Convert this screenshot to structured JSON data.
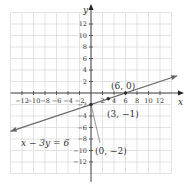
{
  "chart_data": {
    "type": "line",
    "title": "",
    "xlabel": "x",
    "ylabel": "y",
    "xlim": [
      -14,
      15
    ],
    "ylim": [
      -14,
      15
    ],
    "grid": true,
    "x_ticks": [
      -12,
      -10,
      -8,
      -6,
      -4,
      -2,
      2,
      4,
      6,
      8,
      10,
      12
    ],
    "y_ticks": [
      12,
      10,
      8,
      6,
      4,
      2,
      -2,
      -4,
      -6,
      -8,
      -10,
      -12
    ],
    "x_tick_labels": [
      "−12",
      "−10",
      "−8",
      "−6",
      "−4",
      "−2",
      "2",
      "4",
      "6",
      "8",
      "10",
      "12"
    ],
    "y_tick_labels": [
      "12",
      "10",
      "8",
      "6",
      "4",
      "2",
      "−2",
      "−4",
      "−6",
      "−8",
      "−10",
      "−12"
    ],
    "series": [
      {
        "name": "x − 3y = 6",
        "equation": "x - 3y = 6",
        "x": [
          -14,
          15
        ],
        "y": [
          -6.67,
          3
        ],
        "color": "#666666"
      }
    ],
    "points": [
      {
        "x": 6,
        "y": 0,
        "label": "(6, 0)"
      },
      {
        "x": 3,
        "y": -1,
        "label": "(3, −1)"
      },
      {
        "x": 0,
        "y": -2,
        "label": "(0, −2)"
      }
    ],
    "annotations": [
      {
        "text": "x − 3y = 6",
        "near": [
          -9,
          -7
        ]
      }
    ]
  },
  "labels": {
    "x_axis": "x",
    "y_axis": "y",
    "equation": "x − 3y = 6",
    "point_a": "(6, 0)",
    "point_b": "(3, −1)",
    "point_c": "(0, −2)"
  }
}
